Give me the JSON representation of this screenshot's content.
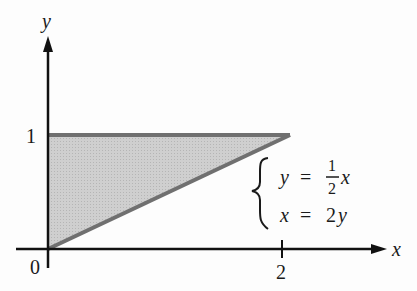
{
  "axes": {
    "x_label": "x",
    "y_label": "y",
    "origin_label": "0",
    "x_tick_label": "2",
    "y_tick_label": "1"
  },
  "region": {
    "vertices": [
      [
        0,
        0
      ],
      [
        0,
        1
      ],
      [
        2,
        1
      ]
    ],
    "fill_color": "#c8c8c8",
    "edge_color": "#6e6e6e"
  },
  "equations": {
    "eq1_lhs": "y",
    "eq1_eq": "=",
    "eq1_num": "1",
    "eq1_den": "2",
    "eq1_var": "x",
    "eq2_lhs": "x",
    "eq2_eq": "=",
    "eq2_rhs_coef": "2",
    "eq2_rhs_var": "y"
  }
}
